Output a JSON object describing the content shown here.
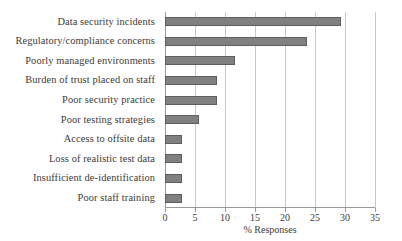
{
  "chart_data": {
    "type": "bar",
    "orientation": "horizontal",
    "title": "",
    "xlabel": "% Responses",
    "ylabel": "",
    "xlim": [
      0,
      35
    ],
    "xticks": [
      0,
      5,
      10,
      15,
      20,
      25,
      30,
      35
    ],
    "grid": "vertical",
    "legend": "none",
    "bar_color": "#808080",
    "bar_edge_color": "#5e5e5e",
    "categories": [
      "Data security incidents",
      "Regulatory/compliance concerns",
      "Poorly managed environments",
      "Burden of trust placed on staff",
      "Poor security practice",
      "Poor testing strategies",
      "Access to offsite data",
      "Loss of realistic test data",
      "Insufficient de-identification",
      "Poor staff training"
    ],
    "values": [
      29.3,
      23.6,
      11.7,
      8.6,
      8.6,
      5.7,
      2.8,
      2.8,
      2.8,
      2.8
    ]
  }
}
